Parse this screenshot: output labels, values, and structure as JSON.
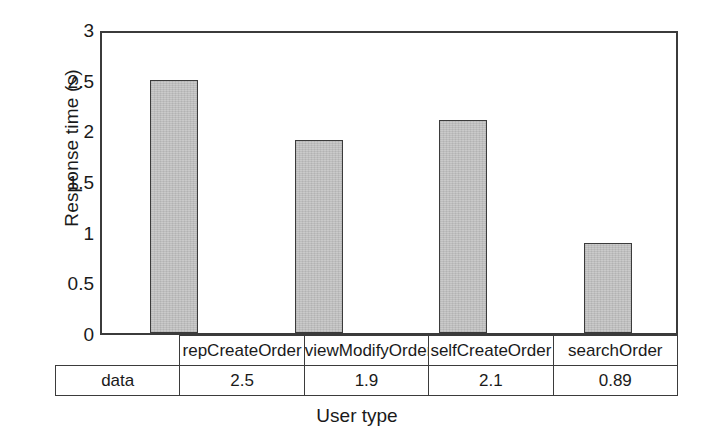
{
  "chart_data": {
    "type": "bar",
    "title": "",
    "xlabel": "User type",
    "ylabel": "Response time (s)",
    "categories": [
      "repCreateOrder",
      "viewModifyOrder",
      "selfCreateOrder",
      "searchOrder"
    ],
    "values": [
      2.5,
      1.9,
      2.1,
      0.89
    ],
    "value_labels": [
      "2.5",
      "1.9",
      "2.1",
      "0.89"
    ],
    "series": [
      {
        "name": "data",
        "values": [
          2.5,
          1.9,
          2.1,
          0.89
        ]
      }
    ],
    "ylim": [
      0,
      3
    ],
    "yticks": [
      0,
      0.5,
      1,
      1.5,
      2,
      2.5,
      3
    ],
    "ytick_labels": [
      "0",
      "0.5",
      "1",
      "1.5",
      "2",
      "2.5",
      "3"
    ],
    "grid": false,
    "legend": false,
    "bar_color": "#c4c4c4",
    "bar_edge_color": "#3b3b3b",
    "axis_color": "#3b3b3b"
  },
  "data_table": {
    "row_label": "data",
    "header_cells": [
      "repCreateOrder",
      "viewModifyOrder",
      "selfCreateOrder",
      "searchOrder"
    ],
    "value_cells": [
      "2.5",
      "1.9",
      "2.1",
      "0.89"
    ]
  }
}
